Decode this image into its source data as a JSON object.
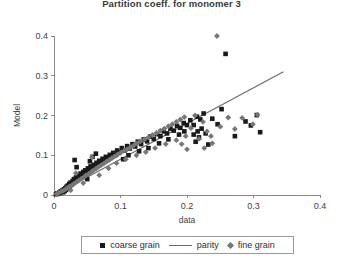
{
  "chart_data": {
    "type": "scatter",
    "title": "Partition coeff. for monomer 3",
    "xlabel": "data",
    "ylabel": "Model",
    "xlim": [
      0,
      0.4
    ],
    "ylim": [
      0,
      0.4
    ],
    "xticks": [
      "0",
      "0.1",
      "0.2",
      "0.3",
      "0.4"
    ],
    "xtick_values": [
      0,
      0.1,
      0.2,
      0.3,
      0.4
    ],
    "yticks": [
      "0",
      "0.1",
      "0.2",
      "0.3",
      "0.4"
    ],
    "ytick_values": [
      0,
      0.1,
      0.2,
      0.3,
      0.4
    ],
    "grid": false,
    "legend_position": "below-axes",
    "series": [
      {
        "name": "coarse grain",
        "marker": "square",
        "color": "#1a1a1a",
        "points": [
          [
            0.003,
            0.002
          ],
          [
            0.005,
            0.004
          ],
          [
            0.006,
            0.003
          ],
          [
            0.008,
            0.006
          ],
          [
            0.009,
            0.005
          ],
          [
            0.01,
            0.009
          ],
          [
            0.012,
            0.008
          ],
          [
            0.013,
            0.012
          ],
          [
            0.014,
            0.007
          ],
          [
            0.015,
            0.014
          ],
          [
            0.016,
            0.01
          ],
          [
            0.017,
            0.017
          ],
          [
            0.018,
            0.013
          ],
          [
            0.019,
            0.021
          ],
          [
            0.02,
            0.016
          ],
          [
            0.021,
            0.024
          ],
          [
            0.022,
            0.019
          ],
          [
            0.023,
            0.028
          ],
          [
            0.024,
            0.022
          ],
          [
            0.025,
            0.031
          ],
          [
            0.026,
            0.026
          ],
          [
            0.028,
            0.035
          ],
          [
            0.029,
            0.03
          ],
          [
            0.03,
            0.04
          ],
          [
            0.032,
            0.034
          ],
          [
            0.033,
            0.044
          ],
          [
            0.035,
            0.039
          ],
          [
            0.036,
            0.049
          ],
          [
            0.038,
            0.043
          ],
          [
            0.04,
            0.054
          ],
          [
            0.042,
            0.048
          ],
          [
            0.044,
            0.058
          ],
          [
            0.045,
            0.052
          ],
          [
            0.047,
            0.062
          ],
          [
            0.049,
            0.057
          ],
          [
            0.051,
            0.067
          ],
          [
            0.053,
            0.061
          ],
          [
            0.055,
            0.072
          ],
          [
            0.057,
            0.066
          ],
          [
            0.06,
            0.076
          ],
          [
            0.062,
            0.07
          ],
          [
            0.064,
            0.081
          ],
          [
            0.066,
            0.075
          ],
          [
            0.068,
            0.086
          ],
          [
            0.071,
            0.08
          ],
          [
            0.073,
            0.091
          ],
          [
            0.076,
            0.085
          ],
          [
            0.078,
            0.096
          ],
          [
            0.081,
            0.09
          ],
          [
            0.084,
            0.101
          ],
          [
            0.086,
            0.095
          ],
          [
            0.089,
            0.106
          ],
          [
            0.092,
            0.1
          ],
          [
            0.095,
            0.112
          ],
          [
            0.031,
            0.088
          ],
          [
            0.034,
            0.07
          ],
          [
            0.05,
            0.04
          ],
          [
            0.054,
            0.085
          ],
          [
            0.058,
            0.096
          ],
          [
            0.063,
            0.104
          ],
          [
            0.098,
            0.107
          ],
          [
            0.102,
            0.118
          ],
          [
            0.106,
            0.112
          ],
          [
            0.11,
            0.123
          ],
          [
            0.114,
            0.117
          ],
          [
            0.118,
            0.128
          ],
          [
            0.122,
            0.122
          ],
          [
            0.126,
            0.134
          ],
          [
            0.131,
            0.128
          ],
          [
            0.135,
            0.14
          ],
          [
            0.14,
            0.135
          ],
          [
            0.145,
            0.147
          ],
          [
            0.15,
            0.141
          ],
          [
            0.155,
            0.153
          ],
          [
            0.16,
            0.148
          ],
          [
            0.165,
            0.16
          ],
          [
            0.17,
            0.155
          ],
          [
            0.175,
            0.167
          ],
          [
            0.18,
            0.162
          ],
          [
            0.185,
            0.174
          ],
          [
            0.19,
            0.169
          ],
          [
            0.195,
            0.181
          ],
          [
            0.2,
            0.176
          ],
          [
            0.205,
            0.188
          ],
          [
            0.21,
            0.176
          ],
          [
            0.215,
            0.197
          ],
          [
            0.21,
            0.152
          ],
          [
            0.213,
            0.134
          ],
          [
            0.216,
            0.16
          ],
          [
            0.218,
            0.145
          ],
          [
            0.22,
            0.19
          ],
          [
            0.222,
            0.167
          ],
          [
            0.225,
            0.205
          ],
          [
            0.228,
            0.155
          ],
          [
            0.232,
            0.127
          ],
          [
            0.238,
            0.192
          ],
          [
            0.246,
            0.178
          ],
          [
            0.252,
            0.216
          ],
          [
            0.258,
            0.355
          ],
          [
            0.272,
            0.148
          ],
          [
            0.288,
            0.185
          ],
          [
            0.296,
            0.175
          ],
          [
            0.305,
            0.201
          ],
          [
            0.31,
            0.158
          ],
          [
            0.104,
            0.09
          ],
          [
            0.112,
            0.1
          ],
          [
            0.128,
            0.11
          ],
          [
            0.142,
            0.118
          ],
          [
            0.158,
            0.13
          ],
          [
            0.172,
            0.14
          ],
          [
            0.188,
            0.152
          ],
          [
            0.196,
            0.16
          ]
        ]
      },
      {
        "name": "fine grain",
        "marker": "diamond",
        "color": "#777777",
        "points": [
          [
            0.004,
            0.003
          ],
          [
            0.007,
            0.005
          ],
          [
            0.011,
            0.009
          ],
          [
            0.014,
            0.011
          ],
          [
            0.017,
            0.014
          ],
          [
            0.02,
            0.018
          ],
          [
            0.023,
            0.021
          ],
          [
            0.027,
            0.025
          ],
          [
            0.03,
            0.028
          ],
          [
            0.034,
            0.033
          ],
          [
            0.037,
            0.036
          ],
          [
            0.041,
            0.041
          ],
          [
            0.045,
            0.045
          ],
          [
            0.048,
            0.049
          ],
          [
            0.052,
            0.053
          ],
          [
            0.056,
            0.058
          ],
          [
            0.059,
            0.062
          ],
          [
            0.063,
            0.066
          ],
          [
            0.067,
            0.071
          ],
          [
            0.071,
            0.075
          ],
          [
            0.075,
            0.079
          ],
          [
            0.079,
            0.084
          ],
          [
            0.083,
            0.088
          ],
          [
            0.087,
            0.093
          ],
          [
            0.091,
            0.097
          ],
          [
            0.096,
            0.102
          ],
          [
            0.1,
            0.106
          ],
          [
            0.105,
            0.111
          ],
          [
            0.11,
            0.115
          ],
          [
            0.115,
            0.12
          ],
          [
            0.12,
            0.125
          ],
          [
            0.125,
            0.13
          ],
          [
            0.13,
            0.135
          ],
          [
            0.136,
            0.14
          ],
          [
            0.142,
            0.145
          ],
          [
            0.148,
            0.151
          ],
          [
            0.154,
            0.156
          ],
          [
            0.16,
            0.162
          ],
          [
            0.166,
            0.167
          ],
          [
            0.172,
            0.173
          ],
          [
            0.178,
            0.178
          ],
          [
            0.184,
            0.184
          ],
          [
            0.19,
            0.19
          ],
          [
            0.196,
            0.196
          ],
          [
            0.025,
            0.012
          ],
          [
            0.033,
            0.055
          ],
          [
            0.044,
            0.03
          ],
          [
            0.057,
            0.095
          ],
          [
            0.068,
            0.05
          ],
          [
            0.082,
            0.067
          ],
          [
            0.094,
            0.08
          ],
          [
            0.108,
            0.09
          ],
          [
            0.124,
            0.1
          ],
          [
            0.138,
            0.108
          ],
          [
            0.152,
            0.118
          ],
          [
            0.168,
            0.128
          ],
          [
            0.184,
            0.138
          ],
          [
            0.198,
            0.148
          ],
          [
            0.206,
            0.168
          ],
          [
            0.212,
            0.2
          ],
          [
            0.218,
            0.141
          ],
          [
            0.224,
            0.184
          ],
          [
            0.23,
            0.16
          ],
          [
            0.236,
            0.148
          ],
          [
            0.245,
            0.4
          ],
          [
            0.25,
            0.172
          ],
          [
            0.262,
            0.195
          ],
          [
            0.272,
            0.166
          ],
          [
            0.283,
            0.194
          ],
          [
            0.299,
            0.178
          ],
          [
            0.306,
            0.202
          ],
          [
            0.226,
            0.118
          ],
          [
            0.238,
            0.13
          ],
          [
            0.2,
            0.115
          ],
          [
            0.192,
            0.128
          ]
        ]
      }
    ],
    "parity": {
      "name": "parity",
      "x": [
        0.0,
        0.345
      ],
      "y": [
        0.0,
        0.31
      ],
      "color": "#6b6b6b"
    }
  },
  "legend": {
    "entries": [
      {
        "label": "coarse grain",
        "marker": "square"
      },
      {
        "label": "parity",
        "marker": "line"
      },
      {
        "label": "fine grain",
        "marker": "diamond"
      }
    ]
  }
}
